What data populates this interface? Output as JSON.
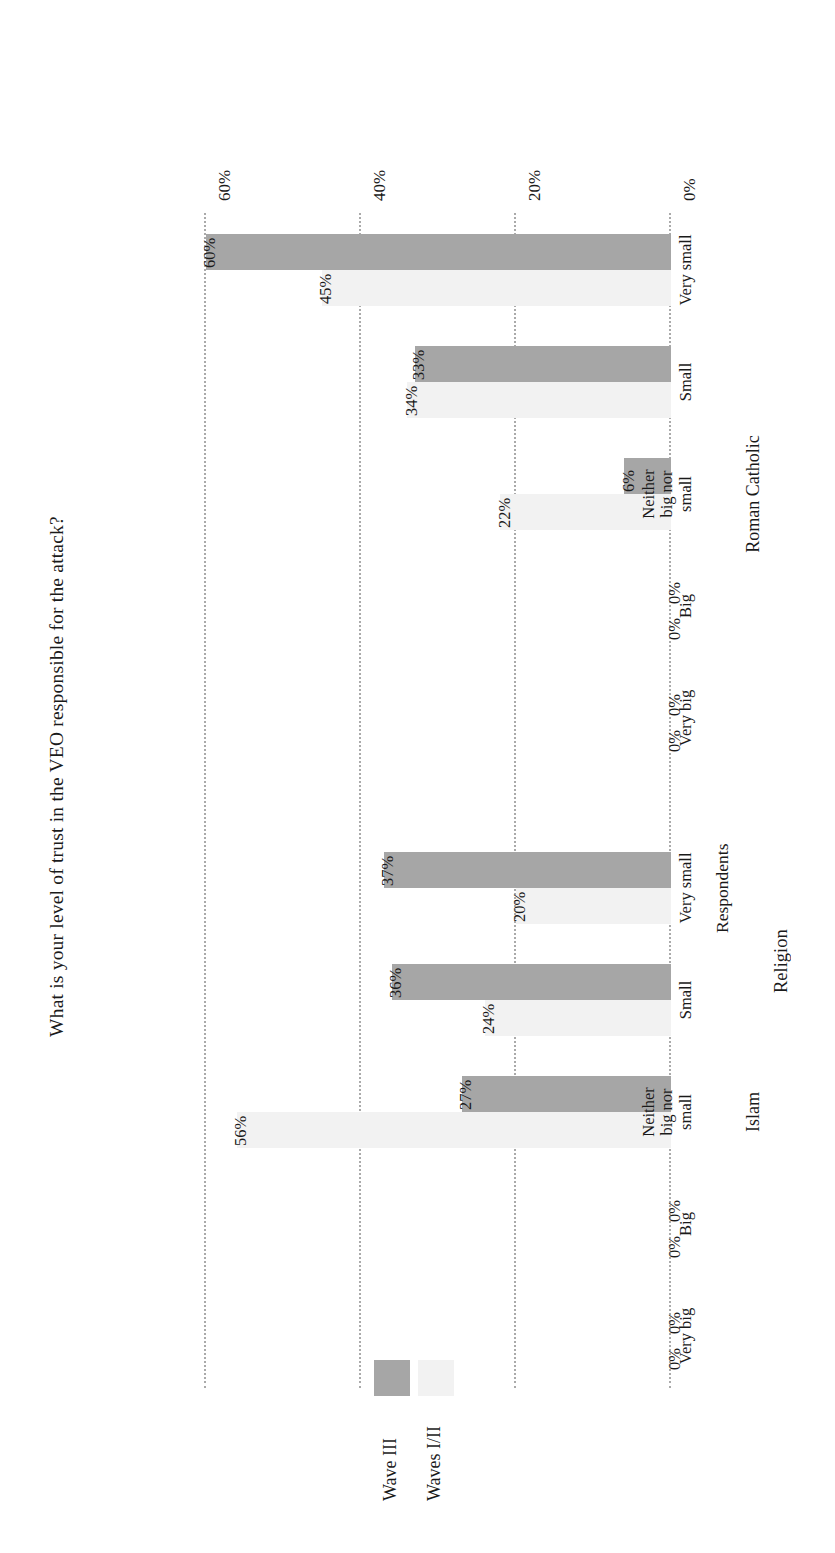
{
  "chart_data": {
    "type": "bar",
    "orientation": "horizontal",
    "title": "What is your level of trust in the VEO responsible for the attack?",
    "xlabel": "Religion",
    "ylabel": "Respondents",
    "ylim": [
      0,
      60
    ],
    "ytick_labels": [
      "0%",
      "20%",
      "40%",
      "60%"
    ],
    "ytick_values": [
      0,
      20,
      40,
      60
    ],
    "grid": true,
    "legend_position": "top-right",
    "groups": [
      {
        "name": "Islam",
        "categories": [
          "Very big",
          "Big",
          "Neither big nor small",
          "Small",
          "Very small"
        ],
        "series": [
          {
            "name": "Waves I/II",
            "values": [
              0,
              0,
              56,
              24,
              20
            ],
            "labels": [
              "0%",
              "0%",
              "56%",
              "24%",
              "20%"
            ],
            "color": "#f2f2f2"
          },
          {
            "name": "Wave III",
            "values": [
              0,
              0,
              27,
              36,
              37
            ],
            "labels": [
              "0%",
              "0%",
              "27%",
              "36%",
              "37%"
            ],
            "color": "#a6a6a6"
          }
        ]
      },
      {
        "name": "Roman Catholic",
        "categories": [
          "Very big",
          "Big",
          "Neither big nor small",
          "Small",
          "Very small"
        ],
        "series": [
          {
            "name": "Waves I/II",
            "values": [
              0,
              0,
              22,
              34,
              45
            ],
            "labels": [
              "0%",
              "0%",
              "22%",
              "34%",
              "45%"
            ],
            "color": "#f2f2f2"
          },
          {
            "name": "Wave III",
            "values": [
              0,
              0,
              6,
              33,
              60
            ],
            "labels": [
              "0%",
              "0%",
              "6%",
              "33%",
              "60%"
            ],
            "color": "#a6a6a6"
          }
        ]
      }
    ],
    "legend": [
      {
        "label": "Waves I/II",
        "color": "#f2f2f2"
      },
      {
        "label": "Wave III",
        "color": "#a6a6a6"
      }
    ],
    "colors": {
      "waves_i_ii": "#f2f2f2",
      "wave_iii": "#a6a6a6",
      "gridline": "#aaaaaa",
      "text": "#1a1a1a",
      "background": "#ffffff"
    }
  }
}
